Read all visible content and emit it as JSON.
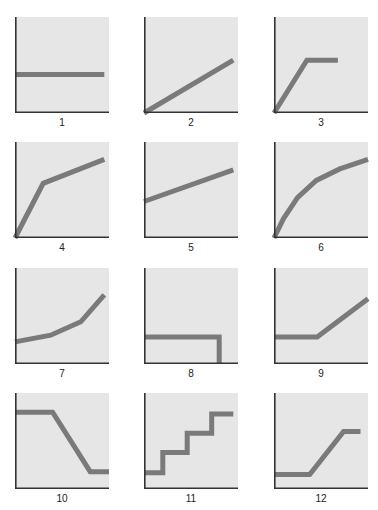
{
  "chart_data": {
    "type": "line",
    "title": "",
    "layout": {
      "rows": 4,
      "cols": 3,
      "grid": false,
      "legend": "none"
    },
    "style": {
      "plot_bg": "#e6e6e6",
      "line_color": "#7a7a7a",
      "axis_color": "#333333"
    },
    "panels": [
      {
        "label": "1",
        "desc": "horizontal constant",
        "points": [
          [
            0,
            0.4
          ],
          [
            0.95,
            0.4
          ]
        ]
      },
      {
        "label": "2",
        "desc": "linear increase from origin",
        "points": [
          [
            0,
            0
          ],
          [
            0.95,
            0.55
          ]
        ]
      },
      {
        "label": "3",
        "desc": "steep rise then plateau",
        "points": [
          [
            0,
            0
          ],
          [
            0.35,
            0.55
          ],
          [
            0.68,
            0.55
          ]
        ]
      },
      {
        "label": "4",
        "desc": "steep rise then slower rise",
        "points": [
          [
            0,
            0
          ],
          [
            0.3,
            0.57
          ],
          [
            0.95,
            0.82
          ]
        ]
      },
      {
        "label": "5",
        "desc": "linear increase with intercept",
        "points": [
          [
            0,
            0.38
          ],
          [
            0.95,
            0.71
          ]
        ]
      },
      {
        "label": "6",
        "desc": "concave increasing curve",
        "points": [
          [
            0,
            0
          ],
          [
            0.1,
            0.2
          ],
          [
            0.25,
            0.42
          ],
          [
            0.45,
            0.6
          ],
          [
            0.7,
            0.72
          ],
          [
            1,
            0.82
          ]
        ]
      },
      {
        "label": "7",
        "desc": "convex increasing",
        "points": [
          [
            0,
            0.23
          ],
          [
            0.38,
            0.3
          ],
          [
            0.7,
            0.44
          ],
          [
            0.95,
            0.72
          ]
        ]
      },
      {
        "label": "8",
        "desc": "constant then drop to zero",
        "points": [
          [
            0,
            0.28
          ],
          [
            0.8,
            0.28
          ],
          [
            0.8,
            0
          ]
        ]
      },
      {
        "label": "9",
        "desc": "constant then linear rise",
        "points": [
          [
            0,
            0.28
          ],
          [
            0.46,
            0.28
          ],
          [
            1,
            0.68
          ]
        ]
      },
      {
        "label": "10",
        "desc": "high plateau, decline, low plateau",
        "points": [
          [
            0,
            0.8
          ],
          [
            0.4,
            0.8
          ],
          [
            0.8,
            0.18
          ],
          [
            1,
            0.18
          ]
        ]
      },
      {
        "label": "11",
        "desc": "staircase",
        "points": [
          [
            0,
            0.17
          ],
          [
            0.2,
            0.17
          ],
          [
            0.2,
            0.38
          ],
          [
            0.46,
            0.38
          ],
          [
            0.46,
            0.58
          ],
          [
            0.72,
            0.58
          ],
          [
            0.72,
            0.78
          ],
          [
            0.95,
            0.78
          ]
        ]
      },
      {
        "label": "12",
        "desc": "low plateau, rise, high plateau",
        "points": [
          [
            0,
            0.15
          ],
          [
            0.38,
            0.15
          ],
          [
            0.74,
            0.6
          ],
          [
            0.92,
            0.6
          ]
        ]
      }
    ]
  }
}
